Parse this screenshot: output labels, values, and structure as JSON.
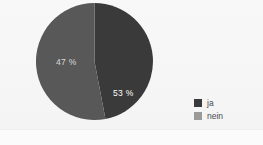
{
  "figure": {
    "background_color": "#f6f6f6",
    "plot_background_color": "#f7f7f7"
  },
  "chart_data": {
    "type": "pie",
    "title": "",
    "subtitle": "",
    "xlabel": "",
    "ylabel": "",
    "grid": false,
    "legend_position": "right",
    "start_angle_deg": 0,
    "direction": "clockwise",
    "categories": [
      "ja",
      "nein"
    ],
    "values": [
      47,
      53
    ],
    "value_unit": "%",
    "slices": [
      {
        "label": "ja",
        "value": 47,
        "display": "47 %",
        "color": "#3a3a3a",
        "text_color": "#d8d8d8"
      },
      {
        "label": "nein",
        "value": 53,
        "display": "53 %",
        "color": "#585858",
        "text_color": "#ffffff"
      }
    ]
  },
  "legend": {
    "items": [
      {
        "label": "ja",
        "color": "#3a3a3a"
      },
      {
        "label": "nein",
        "color": "#9a9a9a"
      }
    ]
  }
}
